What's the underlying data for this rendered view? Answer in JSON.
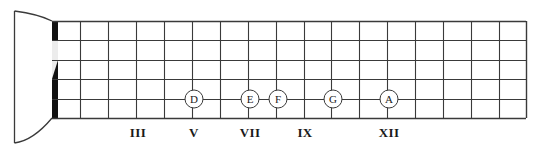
{
  "diagram": {
    "type": "guitar-fretboard",
    "strings_count": 6,
    "frets_count": 17,
    "colors": {
      "line": "#3a3a3a",
      "nut": "#111111",
      "background": "#ffffff",
      "text": "#1a1a1a"
    },
    "geometry": {
      "board_left": 52,
      "board_right": 526,
      "board_top": 21,
      "board_bottom": 118,
      "nut_x": 52,
      "nut_width": 6,
      "fret_spacing": 27.9,
      "string_spacing": 19.4,
      "headstock_x": 14,
      "headstock_top": 11,
      "headstock_bottom": 143
    },
    "fret_labels": [
      {
        "numeral": "III",
        "fret": 3,
        "x": 138
      },
      {
        "numeral": "V",
        "fret": 5,
        "x": 194
      },
      {
        "numeral": "VII",
        "fret": 7,
        "x": 250
      },
      {
        "numeral": "IX",
        "fret": 9,
        "x": 305
      },
      {
        "numeral": "XII",
        "fret": 12,
        "x": 389
      }
    ],
    "notes": [
      {
        "label": "D",
        "fret": 5,
        "string": 1,
        "x": 194,
        "y": 99
      },
      {
        "label": "E",
        "fret": 7,
        "string": 1,
        "x": 250,
        "y": 99
      },
      {
        "label": "F",
        "fret": 8,
        "string": 1,
        "x": 278,
        "y": 99
      },
      {
        "label": "G",
        "fret": 10,
        "string": 1,
        "x": 333,
        "y": 99
      },
      {
        "label": "A",
        "fret": 12,
        "string": 1,
        "x": 389,
        "y": 99
      }
    ],
    "string_lines_y": [
      21,
      40,
      60,
      79,
      99,
      118
    ],
    "fret_lines_x": [
      52,
      80,
      108,
      136,
      164,
      192,
      220,
      248,
      276,
      304,
      331,
      359,
      387,
      415,
      443,
      471,
      499,
      526
    ]
  }
}
